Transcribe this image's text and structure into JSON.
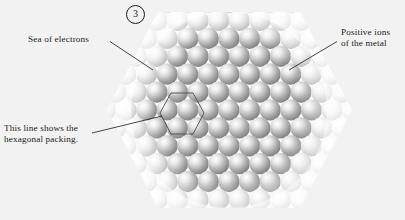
{
  "figure": {
    "step_number": "3",
    "background_color": "#f2f2f2",
    "ink_color": "#1a1a1a"
  },
  "annotations": {
    "sea_of_electrons": {
      "text": "Sea of electrons",
      "icon": "leader-line-icon"
    },
    "positive_ions": {
      "line1": "Positive ions",
      "line2": "of the metal",
      "icon": "leader-line-icon"
    },
    "hexagonal_packing": {
      "line1": "This line shows the",
      "line2": "hexagonal packing.",
      "icon": "leader-line-icon"
    }
  },
  "diagram": {
    "name": "metallic-bonding-close-packed-spheres",
    "outer_shape": "hexagon",
    "inner_region": "circle",
    "sphere_fill_light": "#fdfdfd",
    "sphere_fill_dark": "#8e8e8e",
    "highlight_color": "#ffffff",
    "hexagon_overlay_stroke": "#4a4a4a"
  }
}
